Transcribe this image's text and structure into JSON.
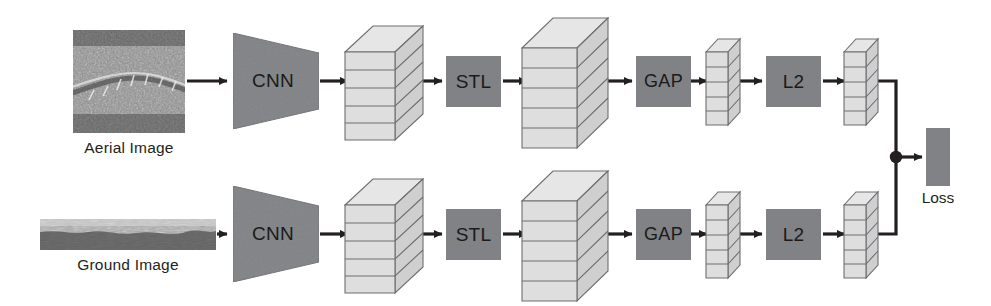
{
  "figure": {
    "type": "diagram",
    "background_color": "#ffffff"
  },
  "palette": {
    "block_gray": "#808285",
    "stack_light": "#dcdcdc",
    "stack_top": "#e8e8e8",
    "stack_side": "#c9c9c9",
    "stack_stroke": "#58595b",
    "arrow": "#231f20",
    "text": "#231f20"
  },
  "branches": [
    {
      "id": "aerial-branch",
      "input": {
        "name": "aerial-image",
        "caption": "Aerial Image",
        "kind": "satellite-photo",
        "shape": "square"
      },
      "stages": [
        {
          "name": "cnn",
          "label": "CNN",
          "shape": "trapezoid"
        },
        {
          "name": "feature-volume-1",
          "label": "",
          "shape": "stacked-cuboid"
        },
        {
          "name": "stl",
          "label": "STL",
          "shape": "rect"
        },
        {
          "name": "feature-volume-2",
          "label": "",
          "shape": "stacked-cuboid"
        },
        {
          "name": "gap",
          "label": "GAP",
          "shape": "rect"
        },
        {
          "name": "feature-vector-1",
          "label": "",
          "shape": "thin-stacked-column"
        },
        {
          "name": "l2",
          "label": "L2",
          "shape": "rect"
        },
        {
          "name": "feature-vector-2",
          "label": "",
          "shape": "thin-stacked-column"
        }
      ]
    },
    {
      "id": "ground-branch",
      "input": {
        "name": "ground-image",
        "caption": "Ground Image",
        "kind": "panorama-photo",
        "shape": "wide-strip"
      },
      "stages": [
        {
          "name": "cnn",
          "label": "CNN",
          "shape": "trapezoid"
        },
        {
          "name": "feature-volume-1",
          "label": "",
          "shape": "stacked-cuboid"
        },
        {
          "name": "stl",
          "label": "STL",
          "shape": "rect"
        },
        {
          "name": "feature-volume-2",
          "label": "",
          "shape": "stacked-cuboid"
        },
        {
          "name": "gap",
          "label": "GAP",
          "shape": "rect"
        },
        {
          "name": "feature-vector-1",
          "label": "",
          "shape": "thin-stacked-column"
        },
        {
          "name": "l2",
          "label": "L2",
          "shape": "rect"
        },
        {
          "name": "feature-vector-2",
          "label": "",
          "shape": "thin-stacked-column"
        }
      ]
    }
  ],
  "merge": {
    "name": "loss",
    "label": "Loss",
    "junction": "filled-dot",
    "shape": "rect"
  },
  "labels": {
    "cnn": "CNN",
    "stl": "STL",
    "gap": "GAP",
    "l2": "L2",
    "loss": "Loss",
    "aerial_caption": "Aerial Image",
    "ground_caption": "Ground Image"
  }
}
